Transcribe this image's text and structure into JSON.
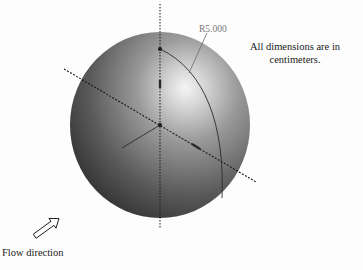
{
  "diagram": {
    "shape": "sphere",
    "dimension_label": "R5.000",
    "note": "All dimensions are in centimeters.",
    "flow_label": "Flow direction",
    "icons": {
      "flow_arrow": "hollow-arrow-up-right"
    },
    "colors": {
      "sphere_dark": "#3a3a3a",
      "sphere_mid": "#7d7d7d",
      "sphere_highlight": "#f2f2f2",
      "axis_line": "#1a1a1a",
      "dimension_text": "#7a7a7a"
    }
  }
}
